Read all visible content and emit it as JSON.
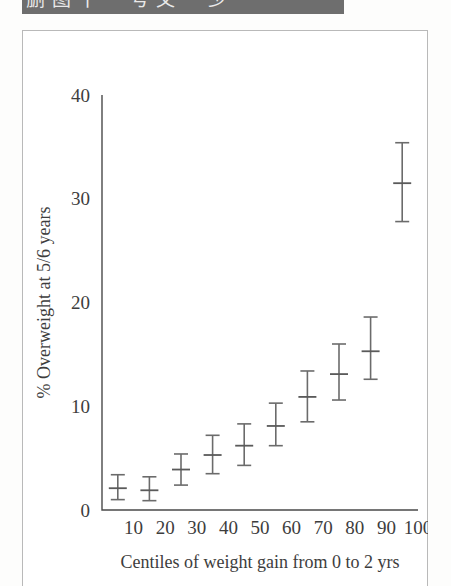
{
  "header": {
    "clipped_text": "删图十一号文一少",
    "bar_color": "#6e6e6e"
  },
  "figure": {
    "frame_color": "#b9b9b9",
    "background": "#ffffff"
  },
  "chart_data": {
    "type": "scatter",
    "title": "",
    "subtitle": "",
    "xlabel": "Centiles of weight gain from 0 to 2 yrs",
    "ylabel": "% Overweight at 5/6 years",
    "xlim": [
      0,
      100
    ],
    "ylim": [
      0,
      40
    ],
    "grid": false,
    "legend": "none",
    "marker": "point-with-error-bars",
    "error_bar_type": "95% confidence interval",
    "xticks": [
      10,
      20,
      30,
      40,
      50,
      60,
      70,
      80,
      90,
      100
    ],
    "xtick_labels": [
      "10",
      "20",
      "30",
      "40",
      "50",
      "60",
      "70",
      "80",
      "90",
      "100"
    ],
    "yticks": [
      0,
      10,
      20,
      30,
      40
    ],
    "ytick_labels": [
      "0",
      "10",
      "20",
      "30",
      "40"
    ],
    "x": [
      5,
      15,
      25,
      35,
      45,
      55,
      65,
      75,
      85,
      95
    ],
    "values": [
      2.1,
      1.9,
      3.9,
      5.3,
      6.2,
      8.1,
      10.9,
      13.1,
      15.3,
      31.5
    ],
    "ci_low": [
      1.0,
      0.9,
      2.4,
      3.5,
      4.3,
      6.2,
      8.5,
      10.6,
      12.6,
      27.8
    ],
    "ci_high": [
      3.4,
      3.2,
      5.4,
      7.2,
      8.3,
      10.3,
      13.4,
      16.0,
      18.6,
      35.4
    ],
    "points": [
      {
        "centile": 5,
        "percent_overweight": 2.1,
        "ci": [
          1.0,
          3.4
        ]
      },
      {
        "centile": 15,
        "percent_overweight": 1.9,
        "ci": [
          0.9,
          3.2
        ]
      },
      {
        "centile": 25,
        "percent_overweight": 3.9,
        "ci": [
          2.4,
          5.4
        ]
      },
      {
        "centile": 35,
        "percent_overweight": 5.3,
        "ci": [
          3.5,
          7.2
        ]
      },
      {
        "centile": 45,
        "percent_overweight": 6.2,
        "ci": [
          4.3,
          8.3
        ]
      },
      {
        "centile": 55,
        "percent_overweight": 8.1,
        "ci": [
          6.2,
          10.3
        ]
      },
      {
        "centile": 65,
        "percent_overweight": 10.9,
        "ci": [
          8.5,
          13.4
        ]
      },
      {
        "centile": 75,
        "percent_overweight": 13.1,
        "ci": [
          10.6,
          16.0
        ]
      },
      {
        "centile": 85,
        "percent_overweight": 15.3,
        "ci": [
          12.6,
          18.6
        ]
      },
      {
        "centile": 95,
        "percent_overweight": 31.5,
        "ci": [
          27.8,
          35.4
        ]
      }
    ]
  }
}
